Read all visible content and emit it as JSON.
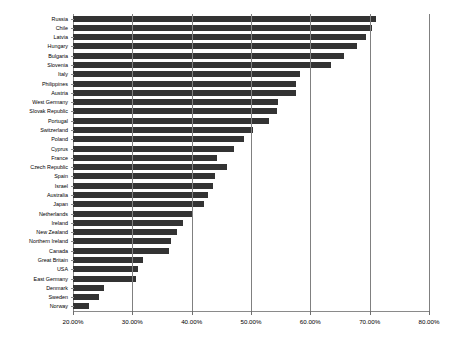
{
  "chart_data": {
    "type": "bar",
    "orientation": "horizontal",
    "title": "",
    "subtitle": "",
    "xlabel": "",
    "ylabel": "",
    "xlim": [
      20,
      80
    ],
    "xticks": [
      20,
      30,
      40,
      50,
      60,
      70,
      80
    ],
    "xtick_labels": [
      "20.00%",
      "30.00%",
      "40.00%",
      "50.00%",
      "60.00%",
      "70.00%",
      "80.00%"
    ],
    "grid": "vertical",
    "legend": "none",
    "bar_color": "#333333",
    "background_color": "#ffffff",
    "axis_color": "#8a8a8a",
    "categories": [
      "Russia",
      "Chile",
      "Latvia",
      "Hungary",
      "Bulgaria",
      "Slovenia",
      "Italy",
      "Philippines",
      "Austria",
      "West Germany",
      "Slovak Republic",
      "Portugal",
      "Switzerland",
      "Poland",
      "Cyprus",
      "France",
      "Czech Republic",
      "Spain",
      "Israel",
      "Australia",
      "Japan",
      "Netherlands",
      "Ireland",
      "New Zealand",
      "Northern Ireland",
      "Canada",
      "Great Britain",
      "USA",
      "East Germany",
      "Denmark",
      "Sweden",
      "Norway"
    ],
    "values": [
      71.1,
      70.4,
      69.4,
      67.9,
      65.7,
      63.4,
      58.3,
      57.6,
      57.6,
      54.5,
      54.4,
      53.1,
      50.4,
      48.9,
      47.1,
      44.3,
      45.9,
      43.9,
      43.6,
      42.7,
      42.0,
      40.2,
      38.5,
      37.5,
      36.5,
      36.1,
      31.8,
      30.9,
      30.7,
      25.3,
      24.4,
      22.7
    ]
  }
}
